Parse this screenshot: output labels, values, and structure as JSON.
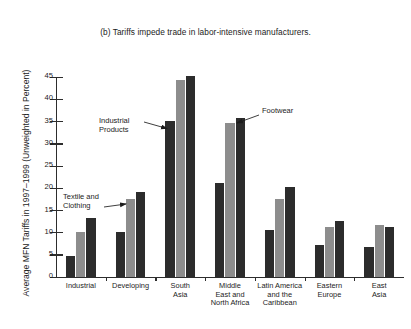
{
  "chart_data": {
    "type": "bar",
    "title": "(b) Tariffs impede trade in labor-intensive manufacturers.",
    "xlabel": "",
    "ylabel": "Average MFN Tariffs in 1997–1999 (Unweighted in Percent)",
    "ylim": [
      0,
      45
    ],
    "y_ticks": [
      0,
      5,
      10,
      15,
      20,
      25,
      30,
      35,
      40,
      45
    ],
    "grid": false,
    "legend_position": "none",
    "categories": [
      "Industrial",
      "Developing",
      "South\nAsia",
      "Middle\nEast and\nNorth Africa",
      "Latin America\nand the\nCaribbean",
      "Eastern\nEurope",
      "East\nAsia"
    ],
    "series": [
      {
        "name": "Industrial Products",
        "color": "#2c2c2c",
        "values": [
          4.6,
          10.1,
          35.0,
          21.0,
          10.6,
          7.1,
          6.6
        ]
      },
      {
        "name": "Textile and Clothing",
        "color": "#8d8d8d",
        "values": [
          10.1,
          17.4,
          44.2,
          34.5,
          17.5,
          11.2,
          11.6
        ]
      },
      {
        "name": "Footwear",
        "color": "#2c2c2c",
        "values": [
          13.3,
          19.0,
          45.1,
          35.6,
          20.2,
          12.6,
          11.2
        ]
      }
    ],
    "annotations": [
      {
        "name": "industrial-products",
        "text": "Industrial\nProducts"
      },
      {
        "name": "footwear",
        "text": "Footwear"
      },
      {
        "name": "textile-and-clothing",
        "text": "Textile and\nClothing"
      }
    ]
  },
  "colors": {
    "dark_bar": "#2c2c2c",
    "gray_bar": "#8d8d8d",
    "axis": "#2d2d2d",
    "text": "#1c1c1c",
    "background": "#ffffff"
  }
}
